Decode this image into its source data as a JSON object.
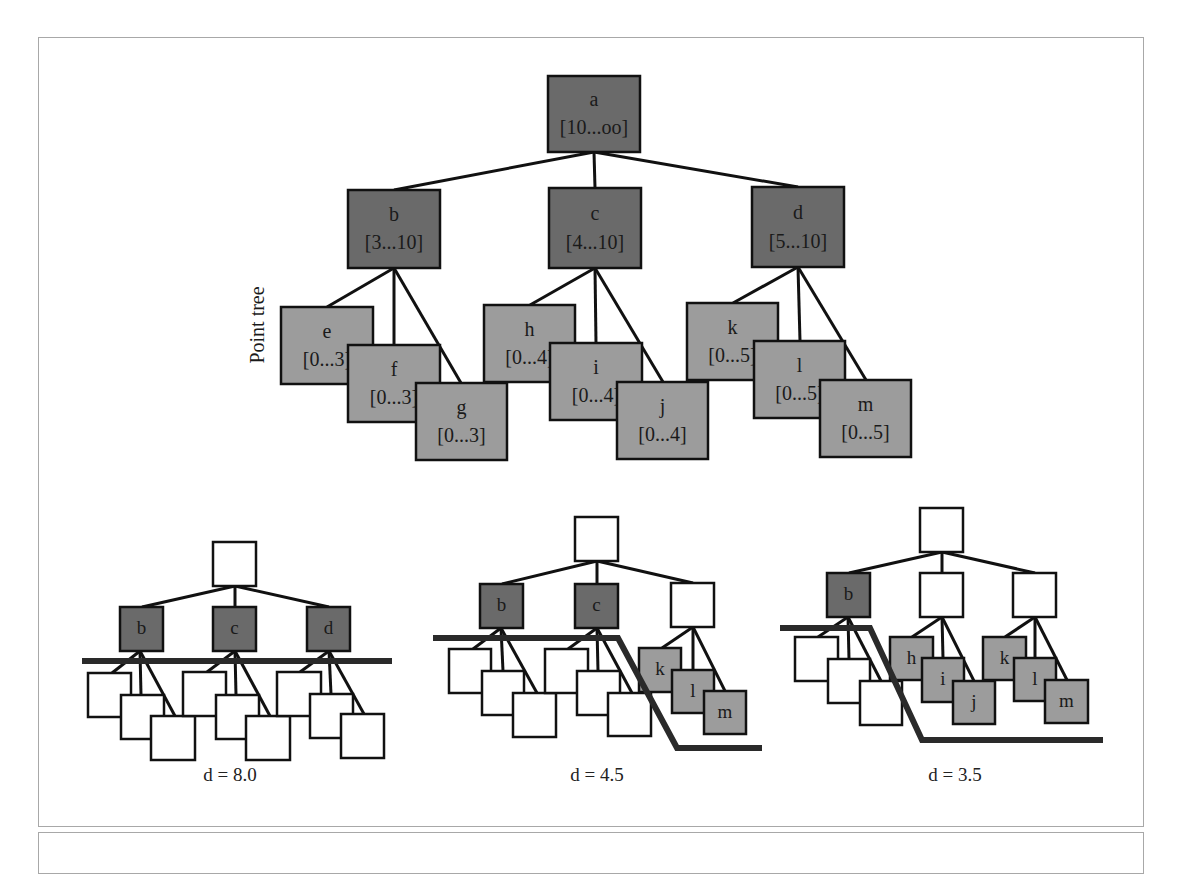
{
  "colors": {
    "dark_node": "#6a6a6a",
    "light_node": "#9c9c9c",
    "empty_node": "#ffffff",
    "stroke": "#111111",
    "frame": "#a8a8a8"
  },
  "point_tree": {
    "side_label": "Point tree",
    "nodes": [
      {
        "id": "a",
        "name": "a",
        "range": "[10...oo]",
        "x": 548,
        "y": 76,
        "w": 92,
        "h": 76,
        "shade": "dark"
      },
      {
        "id": "b",
        "name": "b",
        "range": "[3...10]",
        "x": 348,
        "y": 190,
        "w": 92,
        "h": 78,
        "shade": "dark"
      },
      {
        "id": "c",
        "name": "c",
        "range": "[4...10]",
        "x": 549,
        "y": 188,
        "w": 92,
        "h": 80,
        "shade": "dark"
      },
      {
        "id": "d",
        "name": "d",
        "range": "[5...10]",
        "x": 752,
        "y": 187,
        "w": 92,
        "h": 80,
        "shade": "dark"
      },
      {
        "id": "e",
        "name": "e",
        "range": "[0...3]",
        "x": 281,
        "y": 307,
        "w": 92,
        "h": 77,
        "shade": "light"
      },
      {
        "id": "f",
        "name": "f",
        "range": "[0...3]",
        "x": 348,
        "y": 345,
        "w": 92,
        "h": 77,
        "shade": "light"
      },
      {
        "id": "g",
        "name": "g",
        "range": "[0...3]",
        "x": 416,
        "y": 383,
        "w": 91,
        "h": 77,
        "shade": "light"
      },
      {
        "id": "h",
        "name": "h",
        "range": "[0...4]",
        "x": 484,
        "y": 305,
        "w": 91,
        "h": 77,
        "shade": "light"
      },
      {
        "id": "i",
        "name": "i",
        "range": "[0...4]",
        "x": 550,
        "y": 343,
        "w": 92,
        "h": 77,
        "shade": "light"
      },
      {
        "id": "j",
        "name": "j",
        "range": "[0...4]",
        "x": 617,
        "y": 382,
        "w": 91,
        "h": 77,
        "shade": "light"
      },
      {
        "id": "k",
        "name": "k",
        "range": "[0...5]",
        "x": 687,
        "y": 303,
        "w": 91,
        "h": 77,
        "shade": "light"
      },
      {
        "id": "l",
        "name": "l",
        "range": "[0...5]",
        "x": 754,
        "y": 341,
        "w": 91,
        "h": 77,
        "shade": "light"
      },
      {
        "id": "m",
        "name": "m",
        "range": "[0...5]",
        "x": 820,
        "y": 380,
        "w": 91,
        "h": 77,
        "shade": "light"
      }
    ],
    "edges": [
      [
        594,
        152,
        394,
        190
      ],
      [
        594,
        152,
        595,
        188
      ],
      [
        594,
        152,
        798,
        187
      ],
      [
        394,
        268,
        327,
        307
      ],
      [
        394,
        268,
        394,
        345
      ],
      [
        394,
        268,
        461,
        383
      ],
      [
        595,
        268,
        530,
        305
      ],
      [
        595,
        268,
        596,
        343
      ],
      [
        595,
        268,
        663,
        382
      ],
      [
        798,
        267,
        733,
        303
      ],
      [
        798,
        267,
        800,
        341
      ],
      [
        798,
        267,
        866,
        380
      ]
    ]
  },
  "cuts": [
    {
      "caption": "d = 8.0",
      "caption_x": 230,
      "caption_y": 781,
      "nodes": [
        {
          "label": "",
          "x": 213,
          "y": 542,
          "w": 43,
          "h": 44,
          "shade": "empty"
        },
        {
          "label": "b",
          "x": 120,
          "y": 607,
          "w": 43,
          "h": 44,
          "shade": "dark"
        },
        {
          "label": "c",
          "x": 213,
          "y": 607,
          "w": 43,
          "h": 44,
          "shade": "dark"
        },
        {
          "label": "d",
          "x": 307,
          "y": 607,
          "w": 43,
          "h": 44,
          "shade": "dark"
        },
        {
          "label": "",
          "x": 88,
          "y": 673,
          "w": 43,
          "h": 44,
          "shade": "empty"
        },
        {
          "label": "",
          "x": 121,
          "y": 695,
          "w": 43,
          "h": 44,
          "shade": "empty"
        },
        {
          "label": "",
          "x": 151,
          "y": 716,
          "w": 44,
          "h": 44,
          "shade": "empty"
        },
        {
          "label": "",
          "x": 183,
          "y": 672,
          "w": 43,
          "h": 44,
          "shade": "empty"
        },
        {
          "label": "",
          "x": 216,
          "y": 695,
          "w": 43,
          "h": 44,
          "shade": "empty"
        },
        {
          "label": "",
          "x": 246,
          "y": 716,
          "w": 44,
          "h": 44,
          "shade": "empty"
        },
        {
          "label": "",
          "x": 277,
          "y": 672,
          "w": 44,
          "h": 44,
          "shade": "empty"
        },
        {
          "label": "",
          "x": 310,
          "y": 694,
          "w": 43,
          "h": 44,
          "shade": "empty"
        },
        {
          "label": "",
          "x": 341,
          "y": 714,
          "w": 43,
          "h": 44,
          "shade": "empty"
        }
      ],
      "edges": [
        [
          235,
          586,
          142,
          607
        ],
        [
          235,
          586,
          235,
          607
        ],
        [
          235,
          586,
          329,
          607
        ],
        [
          140,
          651,
          112,
          673
        ],
        [
          140,
          651,
          141,
          695
        ],
        [
          140,
          651,
          175,
          716
        ],
        [
          235,
          651,
          207,
          672
        ],
        [
          235,
          651,
          236,
          695
        ],
        [
          235,
          651,
          270,
          716
        ],
        [
          329,
          651,
          300,
          672
        ],
        [
          329,
          651,
          331,
          694
        ],
        [
          329,
          651,
          364,
          714
        ]
      ],
      "cut_path": "M82,661 L392,661"
    },
    {
      "caption": "d = 4.5",
      "caption_x": 597,
      "caption_y": 781,
      "nodes": [
        {
          "label": "",
          "x": 575,
          "y": 517,
          "w": 43,
          "h": 44,
          "shade": "empty"
        },
        {
          "label": "b",
          "x": 480,
          "y": 584,
          "w": 43,
          "h": 44,
          "shade": "dark"
        },
        {
          "label": "c",
          "x": 575,
          "y": 584,
          "w": 43,
          "h": 44,
          "shade": "dark"
        },
        {
          "label": "",
          "x": 671,
          "y": 583,
          "w": 43,
          "h": 44,
          "shade": "empty"
        },
        {
          "label": "",
          "x": 449,
          "y": 649,
          "w": 42,
          "h": 44,
          "shade": "empty"
        },
        {
          "label": "",
          "x": 482,
          "y": 671,
          "w": 42,
          "h": 44,
          "shade": "empty"
        },
        {
          "label": "",
          "x": 513,
          "y": 693,
          "w": 43,
          "h": 44,
          "shade": "empty"
        },
        {
          "label": "",
          "x": 545,
          "y": 649,
          "w": 43,
          "h": 44,
          "shade": "empty"
        },
        {
          "label": "",
          "x": 577,
          "y": 671,
          "w": 43,
          "h": 44,
          "shade": "empty"
        },
        {
          "label": "",
          "x": 608,
          "y": 693,
          "w": 43,
          "h": 43,
          "shade": "empty"
        },
        {
          "label": "k",
          "x": 639,
          "y": 648,
          "w": 42,
          "h": 44,
          "shade": "light"
        },
        {
          "label": "l",
          "x": 672,
          "y": 670,
          "w": 42,
          "h": 43,
          "shade": "light"
        },
        {
          "label": "m",
          "x": 704,
          "y": 691,
          "w": 42,
          "h": 43,
          "shade": "light"
        }
      ],
      "edges": [
        [
          597,
          561,
          502,
          584
        ],
        [
          597,
          561,
          597,
          584
        ],
        [
          597,
          561,
          693,
          583
        ],
        [
          501,
          628,
          473,
          649
        ],
        [
          501,
          628,
          503,
          671
        ],
        [
          501,
          628,
          537,
          693
        ],
        [
          597,
          628,
          568,
          649
        ],
        [
          597,
          628,
          598,
          671
        ],
        [
          597,
          628,
          632,
          693
        ],
        [
          693,
          627,
          662,
          648
        ],
        [
          693,
          627,
          693,
          670
        ],
        [
          693,
          627,
          725,
          691
        ]
      ],
      "cut_path": "M433,638 L618,638 L677,748 L762,748"
    },
    {
      "caption": "d = 3.5",
      "caption_x": 955,
      "caption_y": 781,
      "nodes": [
        {
          "label": "",
          "x": 920,
          "y": 508,
          "w": 43,
          "h": 44,
          "shade": "empty"
        },
        {
          "label": "b",
          "x": 827,
          "y": 573,
          "w": 43,
          "h": 44,
          "shade": "dark"
        },
        {
          "label": "",
          "x": 920,
          "y": 573,
          "w": 43,
          "h": 44,
          "shade": "empty"
        },
        {
          "label": "",
          "x": 1013,
          "y": 573,
          "w": 43,
          "h": 44,
          "shade": "empty"
        },
        {
          "label": "",
          "x": 795,
          "y": 637,
          "w": 43,
          "h": 44,
          "shade": "empty"
        },
        {
          "label": "",
          "x": 828,
          "y": 659,
          "w": 42,
          "h": 44,
          "shade": "empty"
        },
        {
          "label": "",
          "x": 860,
          "y": 681,
          "w": 42,
          "h": 44,
          "shade": "empty"
        },
        {
          "label": "h",
          "x": 890,
          "y": 637,
          "w": 43,
          "h": 43,
          "shade": "light"
        },
        {
          "label": "i",
          "x": 922,
          "y": 658,
          "w": 42,
          "h": 44,
          "shade": "light"
        },
        {
          "label": "j",
          "x": 953,
          "y": 681,
          "w": 42,
          "h": 43,
          "shade": "light"
        },
        {
          "label": "k",
          "x": 983,
          "y": 637,
          "w": 43,
          "h": 43,
          "shade": "light"
        },
        {
          "label": "l",
          "x": 1014,
          "y": 658,
          "w": 42,
          "h": 43,
          "shade": "light"
        },
        {
          "label": "m",
          "x": 1045,
          "y": 680,
          "w": 43,
          "h": 43,
          "shade": "light"
        }
      ],
      "edges": [
        [
          942,
          552,
          849,
          573
        ],
        [
          942,
          552,
          942,
          573
        ],
        [
          942,
          552,
          1035,
          573
        ],
        [
          848,
          617,
          818,
          637
        ],
        [
          848,
          617,
          849,
          659
        ],
        [
          848,
          617,
          881,
          681
        ],
        [
          942,
          617,
          912,
          637
        ],
        [
          942,
          617,
          943,
          658
        ],
        [
          942,
          617,
          974,
          681
        ],
        [
          1035,
          617,
          1005,
          637
        ],
        [
          1035,
          617,
          1035,
          658
        ],
        [
          1035,
          617,
          1067,
          680
        ]
      ],
      "cut_path": "M780,628 L870,628 L922,740 L1103,740"
    }
  ]
}
